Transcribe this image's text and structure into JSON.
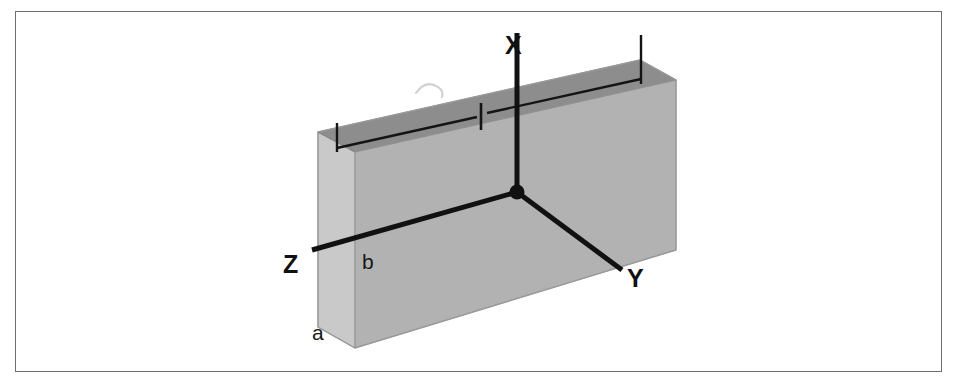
{
  "figure": {
    "kind": "3d-block-coordinate-diagram",
    "background_color": "#ffffff",
    "frame": {
      "border_color": "#6e6e6e",
      "border_width_px": 1.5
    }
  },
  "colors": {
    "top_face": "#8d8d8d",
    "front_face": "#b2b2b2",
    "left_face": "#c9c9c9",
    "outline": "#9a9a9a",
    "axis_line": "#111111",
    "dimension_line": "#111111",
    "label_text": "#111111"
  },
  "axes": {
    "origin": {
      "x": 517,
      "y": 192
    },
    "items": [
      {
        "name": "x-axis",
        "label": "X",
        "direction": "up",
        "end": {
          "x": 517,
          "y": 33
        }
      },
      {
        "name": "y-axis",
        "label": "Y",
        "direction": "down-right",
        "end": {
          "x": 622,
          "y": 270
        }
      },
      {
        "name": "z-axis",
        "label": "Z",
        "direction": "down-left",
        "end": {
          "x": 312,
          "y": 250
        }
      }
    ],
    "origin_marker": "filled-dot"
  },
  "edge_labels": [
    {
      "name": "dimension-a",
      "label": "a",
      "meaning": "block height along left vertical edge"
    },
    {
      "name": "dimension-b",
      "label": "b",
      "meaning": "block depth along front-left edge"
    }
  ],
  "dimension_lines": {
    "count": 2,
    "tick_marks": 3,
    "left_segment": {
      "from_x": 337,
      "to_x": 481
    },
    "right_segment": {
      "from_x": 481,
      "to_x": 641
    },
    "note": "Two abutting dimension lines run parallel to the top back edge with end ticks and a shared centre tick"
  },
  "block": {
    "top_face_points": "318,132 640,60 676,80 355,152",
    "front_face_points": "355,152 676,80 676,250 355,348",
    "left_face_points": "318,132 355,152 355,348 318,327"
  }
}
